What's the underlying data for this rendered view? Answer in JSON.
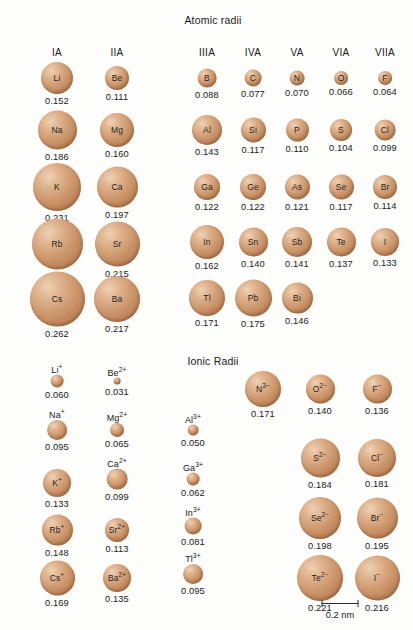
{
  "figure": {
    "units": "nm",
    "sphere_color": "#cf9a70",
    "scale": {
      "caption": "0.2 nm",
      "length_nm": 0.2,
      "bar_px": 37
    }
  },
  "chart_data": {
    "type": "scatter",
    "xlabel": "",
    "ylabel": "",
    "sections": [
      {
        "id": "atomic-radii",
        "title": "Atomic radii",
        "title_x": 213,
        "title_y": 14,
        "blocks": [
          {
            "id": "atomic-left",
            "columns": [
              {
                "group": "IA",
                "x": 57
              },
              {
                "group": "IIA",
                "x": 117
              }
            ],
            "header_y": 47,
            "rows": [
              {
                "y": 78,
                "cells": [
                  {
                    "symbol": "Li",
                    "value": "0.152",
                    "radius_nm": 0.152,
                    "d": 32,
                    "label_inside": true
                  },
                  {
                    "symbol": "Be",
                    "value": "0.111",
                    "radius_nm": 0.111,
                    "d": 24,
                    "label_inside": true
                  }
                ]
              },
              {
                "y": 130,
                "cells": [
                  {
                    "symbol": "Na",
                    "value": "0.186",
                    "radius_nm": 0.186,
                    "d": 39,
                    "label_inside": true
                  },
                  {
                    "symbol": "Mg",
                    "value": "0.160",
                    "radius_nm": 0.16,
                    "d": 34,
                    "label_inside": true
                  }
                ]
              },
              {
                "y": 187,
                "cells": [
                  {
                    "symbol": "K",
                    "value": "0.231",
                    "radius_nm": 0.231,
                    "d": 48,
                    "label_inside": true
                  },
                  {
                    "symbol": "Ca",
                    "value": "0.197",
                    "radius_nm": 0.197,
                    "d": 41,
                    "label_inside": true
                  }
                ]
              },
              {
                "y": 244,
                "cells": [
                  {
                    "symbol": "Rb",
                    "value": "0.244",
                    "radius_nm": 0.244,
                    "d": 51,
                    "label_inside": true
                  },
                  {
                    "symbol": "Sr",
                    "value": "0.215",
                    "radius_nm": 0.215,
                    "d": 45,
                    "label_inside": true
                  }
                ]
              },
              {
                "y": 299,
                "cells": [
                  {
                    "symbol": "Cs",
                    "value": "0.262",
                    "radius_nm": 0.262,
                    "d": 55,
                    "label_inside": true
                  },
                  {
                    "symbol": "Ba",
                    "value": "0.217",
                    "radius_nm": 0.217,
                    "d": 46,
                    "label_inside": true
                  }
                ]
              }
            ]
          },
          {
            "id": "atomic-right",
            "columns": [
              {
                "group": "IIIA",
                "x": 207
              },
              {
                "group": "IVA",
                "x": 253
              },
              {
                "group": "VA",
                "x": 297
              },
              {
                "group": "VIA",
                "x": 341
              },
              {
                "group": "VIIA",
                "x": 385
              }
            ],
            "header_y": 47,
            "rows": [
              {
                "y": 78,
                "cells": [
                  {
                    "symbol": "B",
                    "value": "0.088",
                    "radius_nm": 0.088,
                    "d": 19,
                    "label_inside": true
                  },
                  {
                    "symbol": "C",
                    "value": "0.077",
                    "radius_nm": 0.077,
                    "d": 17,
                    "label_inside": true
                  },
                  {
                    "symbol": "N",
                    "value": "0.070",
                    "radius_nm": 0.07,
                    "d": 15,
                    "label_inside": true
                  },
                  {
                    "symbol": "O",
                    "value": "0.066",
                    "radius_nm": 0.066,
                    "d": 14,
                    "label_inside": true
                  },
                  {
                    "symbol": "F",
                    "value": "0.064",
                    "radius_nm": 0.064,
                    "d": 14,
                    "label_inside": true
                  }
                ]
              },
              {
                "y": 130,
                "cells": [
                  {
                    "symbol": "Al",
                    "value": "0.143",
                    "radius_nm": 0.143,
                    "d": 30,
                    "label_inside": true
                  },
                  {
                    "symbol": "Si",
                    "value": "0.117",
                    "radius_nm": 0.117,
                    "d": 25,
                    "label_inside": true
                  },
                  {
                    "symbol": "P",
                    "value": "0.110",
                    "radius_nm": 0.11,
                    "d": 23,
                    "label_inside": true
                  },
                  {
                    "symbol": "S",
                    "value": "0.104",
                    "radius_nm": 0.104,
                    "d": 22,
                    "label_inside": true
                  },
                  {
                    "symbol": "Cl",
                    "value": "0.099",
                    "radius_nm": 0.099,
                    "d": 21,
                    "label_inside": true
                  }
                ]
              },
              {
                "y": 187,
                "cells": [
                  {
                    "symbol": "Ga",
                    "value": "0.122",
                    "radius_nm": 0.122,
                    "d": 26,
                    "label_inside": true
                  },
                  {
                    "symbol": "Ge",
                    "value": "0.122",
                    "radius_nm": 0.122,
                    "d": 26,
                    "label_inside": true
                  },
                  {
                    "symbol": "As",
                    "value": "0.121",
                    "radius_nm": 0.121,
                    "d": 25,
                    "label_inside": true
                  },
                  {
                    "symbol": "Se",
                    "value": "0.117",
                    "radius_nm": 0.117,
                    "d": 25,
                    "label_inside": true
                  },
                  {
                    "symbol": "Br",
                    "value": "0.114",
                    "radius_nm": 0.114,
                    "d": 24,
                    "label_inside": true
                  }
                ]
              },
              {
                "y": 242,
                "cells": [
                  {
                    "symbol": "In",
                    "value": "0.162",
                    "radius_nm": 0.162,
                    "d": 34,
                    "label_inside": true
                  },
                  {
                    "symbol": "Sn",
                    "value": "0.140",
                    "radius_nm": 0.14,
                    "d": 29,
                    "label_inside": true
                  },
                  {
                    "symbol": "Sb",
                    "value": "0.141",
                    "radius_nm": 0.141,
                    "d": 30,
                    "label_inside": true
                  },
                  {
                    "symbol": "Te",
                    "value": "0.137",
                    "radius_nm": 0.137,
                    "d": 29,
                    "label_inside": true
                  },
                  {
                    "symbol": "I",
                    "value": "0.133",
                    "radius_nm": 0.133,
                    "d": 28,
                    "label_inside": true
                  }
                ]
              },
              {
                "y": 298,
                "cells": [
                  {
                    "symbol": "Tl",
                    "value": "0.171",
                    "radius_nm": 0.171,
                    "d": 36,
                    "label_inside": true
                  },
                  {
                    "symbol": "Pb",
                    "value": "0.175",
                    "radius_nm": 0.175,
                    "d": 37,
                    "label_inside": true
                  },
                  {
                    "symbol": "Bi",
                    "value": "0.146",
                    "radius_nm": 0.146,
                    "d": 31,
                    "label_inside": true
                  }
                ]
              }
            ]
          }
        ]
      },
      {
        "id": "ionic-radii",
        "title": "Ionic Radii",
        "title_x": 213,
        "title_y": 355,
        "blocks": [
          {
            "id": "ionic-cations-1and2",
            "columns": [
              {
                "group": "",
                "x": 57
              },
              {
                "group": "",
                "x": 117
              }
            ],
            "rows": [
              {
                "y": 385,
                "cells": [
                  {
                    "symbol": "Li",
                    "charge": "+",
                    "value": "0.060",
                    "radius_nm": 0.06,
                    "d": 13,
                    "label_inside": false
                  },
                  {
                    "symbol": "Be",
                    "charge": "2+",
                    "value": "0.031",
                    "radius_nm": 0.031,
                    "d": 7,
                    "label_inside": false
                  }
                ]
              },
              {
                "y": 434,
                "cells": [
                  {
                    "symbol": "Na",
                    "charge": "+",
                    "value": "0.095",
                    "radius_nm": 0.095,
                    "d": 20,
                    "label_inside": false
                  },
                  {
                    "symbol": "Mg",
                    "charge": "2+",
                    "value": "0.065",
                    "radius_nm": 0.065,
                    "d": 14,
                    "label_inside": false
                  }
                ]
              },
              {
                "y": 483,
                "cells": [
                  {
                    "symbol": "K",
                    "charge": "+",
                    "value": "0.133",
                    "radius_nm": 0.133,
                    "d": 28,
                    "label_inside": true
                  },
                  {
                    "symbol": "Ca",
                    "charge": "2+",
                    "value": "0.099",
                    "radius_nm": 0.099,
                    "d": 21,
                    "label_inside": false
                  }
                ]
              },
              {
                "y": 530,
                "cells": [
                  {
                    "symbol": "Rb",
                    "charge": "+",
                    "value": "0.148",
                    "radius_nm": 0.148,
                    "d": 31,
                    "label_inside": true
                  },
                  {
                    "symbol": "Sr",
                    "charge": "2+",
                    "value": "0.113",
                    "radius_nm": 0.113,
                    "d": 24,
                    "label_inside": true
                  }
                ]
              },
              {
                "y": 578,
                "cells": [
                  {
                    "symbol": "Cs",
                    "charge": "+",
                    "value": "0.169",
                    "radius_nm": 0.169,
                    "d": 35,
                    "label_inside": true
                  },
                  {
                    "symbol": "Ba",
                    "charge": "2+",
                    "value": "0.135",
                    "radius_nm": 0.135,
                    "d": 28,
                    "label_inside": true
                  }
                ]
              }
            ]
          },
          {
            "id": "ionic-cations-3",
            "columns": [
              {
                "group": "",
                "x": 193
              }
            ],
            "rows": [
              {
                "y": 434,
                "cells": [
                  {
                    "symbol": "Al",
                    "charge": "3+",
                    "value": "0.050",
                    "radius_nm": 0.05,
                    "d": 11,
                    "label_inside": false
                  }
                ]
              },
              {
                "y": 483,
                "cells": [
                  {
                    "symbol": "Ga",
                    "charge": "3+",
                    "value": "0.062",
                    "radius_nm": 0.062,
                    "d": 13,
                    "label_inside": false
                  }
                ]
              },
              {
                "y": 530,
                "cells": [
                  {
                    "symbol": "In",
                    "charge": "3+",
                    "value": "0.081",
                    "radius_nm": 0.081,
                    "d": 17,
                    "label_inside": false
                  }
                ]
              },
              {
                "y": 578,
                "cells": [
                  {
                    "symbol": "Tl",
                    "charge": "3+",
                    "value": "0.095",
                    "radius_nm": 0.095,
                    "d": 20,
                    "label_inside": false
                  }
                ]
              }
            ]
          },
          {
            "id": "ionic-anions",
            "columns": [
              {
                "group": "",
                "x": 263
              },
              {
                "group": "",
                "x": 320
              },
              {
                "group": "",
                "x": 377
              }
            ],
            "rows": [
              {
                "y": 389,
                "cells": [
                  {
                    "symbol": "N",
                    "charge": "3−",
                    "value": "0.171",
                    "radius_nm": 0.171,
                    "d": 36,
                    "label_inside": true
                  },
                  {
                    "symbol": "O",
                    "charge": "2−",
                    "value": "0.140",
                    "radius_nm": 0.14,
                    "d": 29,
                    "label_inside": true
                  },
                  {
                    "symbol": "F",
                    "charge": "−",
                    "value": "0.136",
                    "radius_nm": 0.136,
                    "d": 29,
                    "label_inside": true
                  }
                ]
              },
              {
                "y": 458,
                "cells": [
                  {
                    "symbol": "",
                    "charge": "",
                    "value": "",
                    "d": 0,
                    "label_inside": true
                  },
                  {
                    "symbol": "S",
                    "charge": "2−",
                    "value": "0.184",
                    "radius_nm": 0.184,
                    "d": 39,
                    "label_inside": true
                  },
                  {
                    "symbol": "Cl",
                    "charge": "−",
                    "value": "0.181",
                    "radius_nm": 0.181,
                    "d": 38,
                    "label_inside": true
                  }
                ]
              },
              {
                "y": 518,
                "cells": [
                  {
                    "symbol": "",
                    "charge": "",
                    "value": "",
                    "d": 0,
                    "label_inside": true
                  },
                  {
                    "symbol": "Se",
                    "charge": "2−",
                    "value": "0.198",
                    "radius_nm": 0.198,
                    "d": 42,
                    "label_inside": true
                  },
                  {
                    "symbol": "Br",
                    "charge": "−",
                    "value": "0.195",
                    "radius_nm": 0.195,
                    "d": 41,
                    "label_inside": true
                  }
                ]
              },
              {
                "y": 578,
                "cells": [
                  {
                    "symbol": "",
                    "charge": "",
                    "value": "",
                    "d": 0,
                    "label_inside": true
                  },
                  {
                    "symbol": "Te",
                    "charge": "2−",
                    "value": "0.221",
                    "radius_nm": 0.221,
                    "d": 46,
                    "label_inside": true
                  },
                  {
                    "symbol": "I",
                    "charge": "−",
                    "value": "0.216",
                    "radius_nm": 0.216,
                    "d": 45,
                    "label_inside": true
                  }
                ]
              }
            ]
          }
        ]
      }
    ]
  }
}
